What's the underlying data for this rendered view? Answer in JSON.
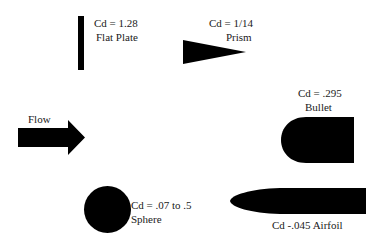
{
  "diagram": {
    "flow_label": "Flow",
    "shapes": [
      {
        "id": "flat-plate",
        "cd": "Cd = 1.28",
        "name": "Flat Plate"
      },
      {
        "id": "prism",
        "cd": "Cd = 1/14",
        "name": "Prism"
      },
      {
        "id": "bullet",
        "cd": "Cd = .295",
        "name": "Bullet"
      },
      {
        "id": "sphere",
        "cd": "Cd = .07 to .5",
        "name": "Sphere"
      },
      {
        "id": "airfoil",
        "cd": "Cd -.045 Airfoil",
        "name": ""
      }
    ],
    "colors": {
      "shape": "#000000",
      "background": "#ffffff"
    }
  }
}
